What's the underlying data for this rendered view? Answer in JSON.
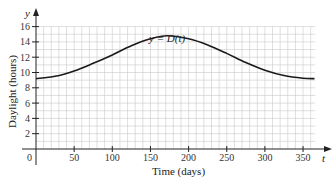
{
  "chart_data": {
    "type": "line",
    "title": "",
    "xlabel": "Time (days)",
    "ylabel": "Daylight (hours)",
    "x_axis_var": "t",
    "y_axis_var": "y",
    "curve_label": "y = D(t)",
    "xlim": [
      0,
      366
    ],
    "ylim": [
      0,
      16
    ],
    "x_ticks": [
      0,
      50,
      100,
      150,
      200,
      250,
      300,
      350
    ],
    "x_tick_labels": [
      "0",
      "50",
      "100",
      "150",
      "200",
      "250",
      "300",
      "350"
    ],
    "y_ticks": [
      2,
      4,
      6,
      8,
      10,
      12,
      14,
      16
    ],
    "y_tick_labels": [
      "2",
      "4",
      "6",
      "8",
      "10",
      "12",
      "14",
      "16"
    ],
    "grid": true,
    "legend": "none",
    "series": [
      {
        "name": "D(t)",
        "x": [
          0,
          25,
          50,
          75,
          100,
          125,
          150,
          172,
          200,
          225,
          250,
          275,
          300,
          325,
          350,
          365
        ],
        "y": [
          9.2,
          9.5,
          10.2,
          11.2,
          12.3,
          13.5,
          14.4,
          14.8,
          14.4,
          13.6,
          12.5,
          11.3,
          10.3,
          9.6,
          9.25,
          9.2
        ]
      }
    ]
  },
  "labels": {
    "y_var": "y",
    "t_var": "t",
    "origin": "0",
    "curve": "y = D(t)",
    "xlabel": "Time (days)",
    "ylabel": "Daylight (hours)"
  }
}
